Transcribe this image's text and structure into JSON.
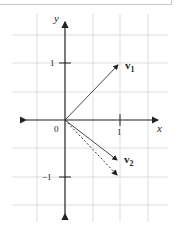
{
  "diagram": {
    "axes": {
      "x_label": "x",
      "y_label": "y",
      "origin_label": "0",
      "x_tick_labels": [
        "1"
      ],
      "y_tick_labels": [
        "1",
        "−1"
      ]
    },
    "vectors": [
      {
        "name": "v1",
        "label_main": "v",
        "label_sub": "1",
        "from": [
          0,
          0
        ],
        "to": [
          1,
          1
        ],
        "style": "solid"
      },
      {
        "name": "v2",
        "label_main": "v",
        "label_sub": "2",
        "from": [
          0,
          0
        ],
        "to": [
          1,
          -0.75
        ],
        "style": "solid"
      },
      {
        "name": "dotted",
        "from": [
          0,
          0
        ],
        "to": [
          1,
          -1
        ],
        "style": "dotted"
      }
    ],
    "grid": {
      "x_range": [
        -1,
        2
      ],
      "y_range": [
        -2,
        2
      ],
      "step": 0.5
    },
    "colors": {
      "axis": "#222222",
      "grid": "#d4d4d4",
      "vector": "#333333"
    }
  }
}
